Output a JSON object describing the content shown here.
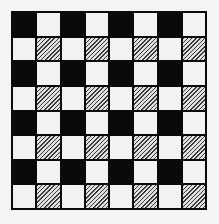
{
  "board": {
    "rows": 8,
    "cols": 8,
    "cell_types": {
      "B": "black",
      "W": "white",
      "H": "hatched"
    },
    "grid": [
      [
        "B",
        "W",
        "B",
        "W",
        "B",
        "W",
        "B",
        "W"
      ],
      [
        "W",
        "H",
        "W",
        "H",
        "W",
        "H",
        "W",
        "H"
      ],
      [
        "B",
        "W",
        "B",
        "W",
        "B",
        "W",
        "B",
        "W"
      ],
      [
        "W",
        "H",
        "W",
        "H",
        "W",
        "H",
        "W",
        "H"
      ],
      [
        "B",
        "W",
        "B",
        "W",
        "B",
        "W",
        "B",
        "W"
      ],
      [
        "W",
        "H",
        "W",
        "H",
        "W",
        "H",
        "W",
        "H"
      ],
      [
        "B",
        "W",
        "B",
        "W",
        "B",
        "W",
        "B",
        "W"
      ],
      [
        "W",
        "H",
        "W",
        "H",
        "W",
        "H",
        "W",
        "H"
      ]
    ],
    "colors": {
      "black": "#0a0a0a",
      "white": "#f2f2f2",
      "hatch_line": "#3a3a3a",
      "background": "#f4f4f4"
    }
  }
}
